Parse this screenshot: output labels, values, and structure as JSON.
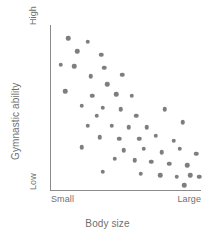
{
  "chart_data": {
    "type": "scatter",
    "title": "",
    "xlabel": "Body size",
    "ylabel": "Gymnastic ability",
    "xtick_labels": [
      "Small",
      "Large"
    ],
    "ytick_labels": [
      "Low",
      "High"
    ],
    "xlim": [
      0,
      100
    ],
    "ylim": [
      0,
      100
    ],
    "grid": false,
    "legend": "none",
    "marker_color": "#7e7e7e",
    "axis_color": "#8a8a8a",
    "text_color": "#6f6f6f",
    "relationship": "negative correlation",
    "point_count": 48,
    "points": [
      {
        "x": 12,
        "y": 92
      },
      {
        "x": 25,
        "y": 90
      },
      {
        "x": 18,
        "y": 84
      },
      {
        "x": 34,
        "y": 82
      },
      {
        "x": 7,
        "y": 76
      },
      {
        "x": 16,
        "y": 75
      },
      {
        "x": 36,
        "y": 74
      },
      {
        "x": 27,
        "y": 69
      },
      {
        "x": 48,
        "y": 70
      },
      {
        "x": 38,
        "y": 64
      },
      {
        "x": 10,
        "y": 60
      },
      {
        "x": 28,
        "y": 57
      },
      {
        "x": 44,
        "y": 58
      },
      {
        "x": 54,
        "y": 57
      },
      {
        "x": 21,
        "y": 51
      },
      {
        "x": 35,
        "y": 50
      },
      {
        "x": 47,
        "y": 49
      },
      {
        "x": 31,
        "y": 45
      },
      {
        "x": 57,
        "y": 45
      },
      {
        "x": 76,
        "y": 49
      },
      {
        "x": 25,
        "y": 39
      },
      {
        "x": 41,
        "y": 39
      },
      {
        "x": 52,
        "y": 38
      },
      {
        "x": 64,
        "y": 38
      },
      {
        "x": 88,
        "y": 41
      },
      {
        "x": 33,
        "y": 32
      },
      {
        "x": 46,
        "y": 31
      },
      {
        "x": 59,
        "y": 31
      },
      {
        "x": 70,
        "y": 33
      },
      {
        "x": 82,
        "y": 30
      },
      {
        "x": 21,
        "y": 26
      },
      {
        "x": 49,
        "y": 24
      },
      {
        "x": 62,
        "y": 25
      },
      {
        "x": 74,
        "y": 23
      },
      {
        "x": 86,
        "y": 25
      },
      {
        "x": 97,
        "y": 22
      },
      {
        "x": 43,
        "y": 19
      },
      {
        "x": 56,
        "y": 18
      },
      {
        "x": 67,
        "y": 17
      },
      {
        "x": 79,
        "y": 16
      },
      {
        "x": 91,
        "y": 15
      },
      {
        "x": 35,
        "y": 11
      },
      {
        "x": 60,
        "y": 10
      },
      {
        "x": 73,
        "y": 9
      },
      {
        "x": 84,
        "y": 8
      },
      {
        "x": 93,
        "y": 9
      },
      {
        "x": 99,
        "y": 8
      },
      {
        "x": 89,
        "y": 3
      }
    ]
  }
}
